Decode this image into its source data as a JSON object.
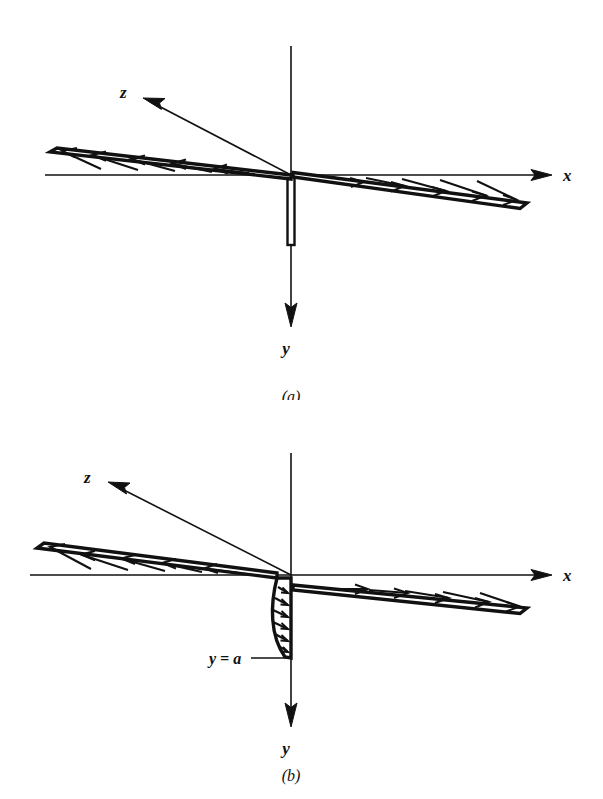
{
  "figure": {
    "background_color": "#ffffff",
    "ink_color": "#111111",
    "width": 603,
    "height": 799
  },
  "panels": [
    {
      "id": "a",
      "caption": "(a)",
      "caption_x": 291,
      "caption_y": 397,
      "origin": {
        "x": 291,
        "y": 175
      },
      "axes": [
        {
          "name": "x",
          "label": "x",
          "label_x": 565,
          "label_y": 175,
          "from": {
            "x": 45,
            "y": 175
          },
          "to": {
            "x": 552,
            "y": 175
          },
          "arrow_at": "to"
        },
        {
          "name": "y",
          "label": "y",
          "label_x": 291,
          "label_y": 347,
          "from": {
            "x": 291,
            "y": 46
          },
          "to": {
            "x": 291,
            "y": 325
          },
          "arrow_at": "to"
        },
        {
          "name": "z",
          "label": "z",
          "label_x": 126,
          "label_y": 92,
          "from": {
            "x": 291,
            "y": 175
          },
          "to": {
            "x": 143,
            "y": 98
          },
          "arrow_at": "to"
        }
      ],
      "plate": {
        "name": "thin-flat-plate",
        "orientation": "vertical",
        "top": {
          "x": 291,
          "y": 175
        },
        "bottom": {
          "x": 291,
          "y": 245
        },
        "half_width": 3.5
      },
      "profiles": [
        {
          "name": "upstream-uniform-profile",
          "side": "left",
          "direction": "left",
          "tip": {
            "x": 55,
            "y": 148
          },
          "base": {
            "x": 291,
            "y": 175
          },
          "arrow_count": 6,
          "shape": "uniform-wedge"
        },
        {
          "name": "downstream-uniform-profile",
          "side": "right",
          "direction": "right",
          "tip": {
            "x": 524,
            "y": 207
          },
          "base": {
            "x": 293,
            "y": 176
          },
          "arrow_count": 6,
          "shape": "uniform-wedge"
        }
      ]
    },
    {
      "id": "b",
      "caption": "(b)",
      "caption_x": 291,
      "caption_y": 776,
      "origin": {
        "x": 291,
        "y": 575
      },
      "axes": [
        {
          "name": "x",
          "label": "x",
          "label_x": 565,
          "label_y": 575,
          "from": {
            "x": 30,
            "y": 575
          },
          "to": {
            "x": 552,
            "y": 575
          },
          "arrow_at": "to"
        },
        {
          "name": "y",
          "label": "y",
          "label_x": 291,
          "label_y": 747,
          "from": {
            "x": 291,
            "y": 453
          },
          "to": {
            "x": 291,
            "y": 725
          },
          "arrow_at": "to"
        },
        {
          "name": "z",
          "label": "z",
          "label_x": 90,
          "label_y": 477,
          "from": {
            "x": 291,
            "y": 575
          },
          "to": {
            "x": 108,
            "y": 482
          },
          "arrow_at": "to"
        }
      ],
      "annotation": {
        "name": "y-equals-a",
        "text": "y = a",
        "label_x": 217,
        "label_y": 661,
        "leader_from": {
          "x": 247,
          "y": 657
        },
        "leader_to": {
          "x": 288,
          "y": 657
        }
      },
      "profiles": [
        {
          "name": "upstream-uniform-profile",
          "side": "left",
          "direction": "left",
          "tip": {
            "x": 42,
            "y": 546
          },
          "base": {
            "x": 277,
            "y": 574
          },
          "arrow_count": 6,
          "shape": "uniform-wedge"
        },
        {
          "name": "boundary-layer-profile",
          "side": "below",
          "direction": "right",
          "top": {
            "x": 277,
            "y": 578
          },
          "bottom": {
            "x": 291,
            "y": 658
          },
          "wall": {
            "x": 291
          },
          "arrow_count": 7,
          "shape": "parabolic"
        },
        {
          "name": "downstream-uniform-profile",
          "side": "right",
          "direction": "right",
          "tip": {
            "x": 524,
            "y": 612
          },
          "base": {
            "x": 293,
            "y": 588
          },
          "arrow_count": 6,
          "shape": "uniform-wedge"
        }
      ]
    }
  ]
}
